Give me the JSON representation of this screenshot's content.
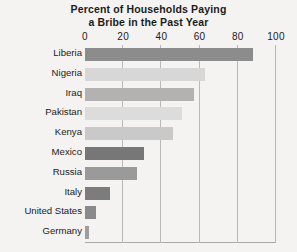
{
  "chart_data": {
    "type": "bar",
    "orientation": "horizontal",
    "title": "Percent of Households Paying a Bribe in the Past Year",
    "title_lines": [
      "Percent of Households Paying",
      "a Bribe in the Past Year"
    ],
    "xlabel": "",
    "ylabel": "",
    "categories": [
      "Liberia",
      "Nigeria",
      "Iraq",
      "Pakistan",
      "Kenya",
      "Mexico",
      "Russia",
      "Italy",
      "United States",
      "Germany"
    ],
    "values": [
      88,
      63,
      57,
      51,
      46,
      31,
      27,
      13,
      6,
      2
    ],
    "xlim": [
      0,
      100
    ],
    "xticks": [
      0,
      20,
      40,
      60,
      80,
      100
    ],
    "xtick_labels": [
      "0",
      "20",
      "40",
      "60",
      "80",
      "100"
    ],
    "grid": true,
    "legend": "none",
    "bar_colors": [
      "#8c8c8c",
      "#d7d7d7",
      "#b2b2b2",
      "#dcdcdc",
      "#c9c9c9",
      "#777777",
      "#9a9a9a",
      "#7c7c7c",
      "#8a8a8a",
      "#9e9e9e"
    ],
    "colors": {
      "background": "#f4f3f1",
      "gridline": "#b8b8b8",
      "axis": "#a9a9a9",
      "text": "#1b1b1b"
    }
  }
}
